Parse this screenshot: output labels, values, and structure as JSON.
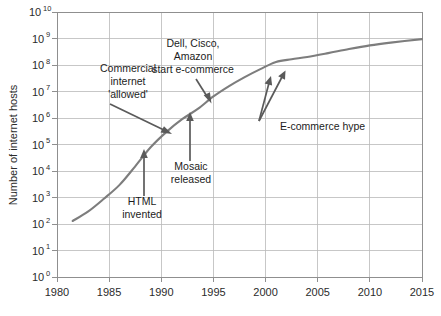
{
  "chart_data": {
    "type": "line",
    "title": "",
    "xlabel": "",
    "ylabel": "Number of internet hosts",
    "yscale": "log",
    "xlim": [
      1980,
      2015
    ],
    "ylim": [
      1,
      10000000000
    ],
    "grid": true,
    "legend": "none",
    "xticks": [
      "1980",
      "1985",
      "1990",
      "1995",
      "2000",
      "2005",
      "2010",
      "2015"
    ],
    "xtick_values": [
      1980,
      1985,
      1990,
      1995,
      2000,
      2005,
      2010,
      2015
    ],
    "yticks": [
      {
        "base": "10",
        "exp": "0",
        "value": 1
      },
      {
        "base": "10",
        "exp": "1",
        "value": 10
      },
      {
        "base": "10",
        "exp": "2",
        "value": 100
      },
      {
        "base": "10",
        "exp": "3",
        "value": 1000
      },
      {
        "base": "10",
        "exp": "4",
        "value": 10000
      },
      {
        "base": "10",
        "exp": "5",
        "value": 100000
      },
      {
        "base": "10",
        "exp": "6",
        "value": 1000000
      },
      {
        "base": "10",
        "exp": "7",
        "value": 10000000
      },
      {
        "base": "10",
        "exp": "8",
        "value": 100000000
      },
      {
        "base": "10",
        "exp": "9",
        "value": 1000000000
      },
      {
        "base": "10",
        "exp": "10",
        "value": 10000000000
      }
    ],
    "series": [
      {
        "name": "Internet hosts",
        "color": "#7d7d7d",
        "x": [
          1981.5,
          1983,
          1984.5,
          1986,
          1987.5,
          1989,
          1990.5,
          1992,
          1993.5,
          1995,
          1996.5,
          1998,
          1999.5,
          2001,
          2002.5,
          2004,
          2006,
          2008,
          2010,
          2012,
          2015
        ],
        "y": [
          130,
          300,
          900,
          3000,
          15000,
          80000,
          300000,
          900000,
          2200000,
          6500000,
          16000000,
          35000000,
          70000000,
          130000000,
          165000000,
          200000000,
          280000000,
          400000000,
          550000000,
          700000000,
          950000000
        ]
      }
    ],
    "annotations": [
      {
        "id": "commercial-internet",
        "lines": [
          "Commercial",
          "internet",
          "'allowed'"
        ],
        "target_x": 1992.2,
        "target_y": 700000
      },
      {
        "id": "dell-cisco-amazon",
        "lines": [
          "Dell, Cisco,",
          "Amazon",
          "start e-commerce"
        ],
        "target_x": 1996.4,
        "target_y": 12000000
      },
      {
        "id": "html-invented",
        "lines": [
          "HTML",
          "invented"
        ],
        "target_x": 1990.5,
        "target_y": 250000
      },
      {
        "id": "mosaic-released",
        "lines": [
          "Mosaic",
          "released"
        ],
        "target_x": 1993.5,
        "target_y": 2300000
      },
      {
        "id": "ecommerce-hype",
        "lines": [
          "E-commerce hype"
        ],
        "target_x": 2001.5,
        "target_y": 130000000
      }
    ]
  }
}
